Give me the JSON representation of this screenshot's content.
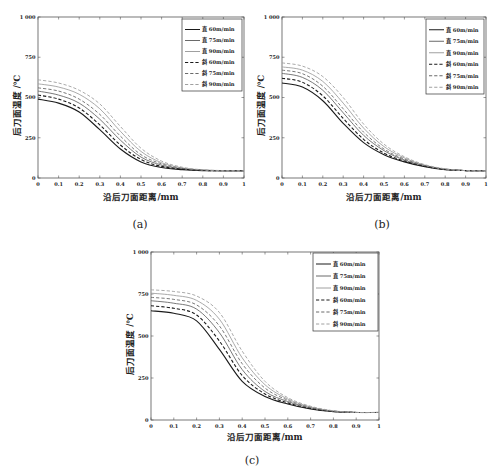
{
  "figure": {
    "captions": [
      "(a)",
      "(b)",
      "(c)"
    ]
  },
  "styles": {
    "series_colors": {
      "60": "#1a1a1a",
      "75": "#6a6a6a",
      "90": "#a0a0a0"
    },
    "axis_color": "#555555",
    "background": "#ffffff"
  },
  "chart_data": [
    {
      "id": "a",
      "type": "line",
      "caption": "(a)",
      "title": "",
      "xlabel": "沿后刀面距离/mm",
      "ylabel": "后刀面温度 /℃",
      "xlim": [
        0,
        1
      ],
      "ylim": [
        0,
        1000
      ],
      "xticks": [
        "0",
        "0.1",
        "0.2",
        "0.3",
        "0.4",
        "0.5",
        "0.6",
        "0.7",
        "0.8",
        "0.9",
        "1"
      ],
      "yticks": [
        "0",
        "250",
        "500",
        "750",
        "1 000"
      ],
      "ytick_values": [
        0,
        250,
        500,
        750,
        1000
      ],
      "grid": false,
      "legend_position": "upper right",
      "x": [
        0,
        0.1,
        0.2,
        0.3,
        0.4,
        0.5,
        0.6,
        0.7,
        0.8,
        0.9,
        1.0
      ],
      "series": [
        {
          "name": "直 60m/min",
          "style": "solid",
          "speed": "60",
          "values": [
            490,
            465,
            410,
            300,
            180,
            100,
            65,
            52,
            46,
            45,
            45
          ]
        },
        {
          "name": "直 75m/min",
          "style": "solid",
          "speed": "75",
          "values": [
            540,
            515,
            465,
            365,
            235,
            130,
            80,
            57,
            48,
            45,
            45
          ]
        },
        {
          "name": "直 90m/min",
          "style": "solid",
          "speed": "90",
          "values": [
            585,
            565,
            520,
            430,
            290,
            165,
            95,
            63,
            50,
            46,
            45
          ]
        },
        {
          "name": "斜 60m/min",
          "style": "dashed",
          "speed": "60",
          "values": [
            515,
            490,
            435,
            330,
            205,
            115,
            72,
            55,
            47,
            45,
            45
          ]
        },
        {
          "name": "斜 75m/min",
          "style": "dashed",
          "speed": "75",
          "values": [
            560,
            540,
            490,
            395,
            260,
            145,
            88,
            60,
            49,
            45,
            45
          ]
        },
        {
          "name": "斜 90m/min",
          "style": "dashed",
          "speed": "90",
          "values": [
            610,
            590,
            545,
            460,
            320,
            185,
            105,
            67,
            51,
            46,
            45
          ]
        }
      ]
    },
    {
      "id": "b",
      "type": "line",
      "caption": "(b)",
      "title": "",
      "xlabel": "沿后刀面距离/mm",
      "ylabel": "后刀面温度 /℃",
      "xlim": [
        0,
        1
      ],
      "ylim": [
        0,
        1000
      ],
      "xticks": [
        "0",
        "0.1",
        "0.2",
        "0.3",
        "0.4",
        "0.5",
        "0.6",
        "0.7",
        "0.8",
        "0.9",
        "1"
      ],
      "yticks": [
        "0",
        "250",
        "500",
        "750",
        "1 000"
      ],
      "ytick_values": [
        0,
        250,
        500,
        750,
        1000
      ],
      "grid": false,
      "legend_position": "upper right",
      "x": [
        0,
        0.1,
        0.2,
        0.3,
        0.4,
        0.5,
        0.6,
        0.7,
        0.8,
        0.9,
        1.0
      ],
      "series": [
        {
          "name": "直 60m/min",
          "style": "solid",
          "speed": "60",
          "values": [
            590,
            565,
            480,
            340,
            220,
            145,
            100,
            70,
            52,
            46,
            45
          ]
        },
        {
          "name": "直 75m/min",
          "style": "solid",
          "speed": "75",
          "values": [
            650,
            625,
            545,
            405,
            265,
            170,
            112,
            76,
            54,
            46,
            45
          ]
        },
        {
          "name": "直 90m/min",
          "style": "solid",
          "speed": "90",
          "values": [
            690,
            670,
            600,
            465,
            310,
            195,
            125,
            80,
            56,
            46,
            45
          ]
        },
        {
          "name": "斜 60m/min",
          "style": "dashed",
          "speed": "60",
          "values": [
            620,
            595,
            510,
            370,
            240,
            155,
            105,
            73,
            53,
            46,
            45
          ]
        },
        {
          "name": "斜 75m/min",
          "style": "dashed",
          "speed": "75",
          "values": [
            670,
            648,
            570,
            430,
            285,
            180,
            118,
            78,
            55,
            46,
            45
          ]
        },
        {
          "name": "斜 90m/min",
          "style": "dashed",
          "speed": "90",
          "values": [
            715,
            695,
            630,
            500,
            335,
            210,
            132,
            83,
            57,
            46,
            45
          ]
        }
      ]
    },
    {
      "id": "c",
      "type": "line",
      "caption": "(c)",
      "title": "",
      "xlabel": "沿后刀面距离/mm",
      "ylabel": "后刀面温度 /℃",
      "xlim": [
        0,
        1
      ],
      "ylim": [
        0,
        1000
      ],
      "xticks": [
        "0",
        "0.1",
        "0.2",
        "0.3",
        "0.4",
        "0.5",
        "0.6",
        "0.7",
        "0.8",
        "0.9",
        "1"
      ],
      "yticks": [
        "0",
        "250",
        "500",
        "750",
        "1 000"
      ],
      "ytick_values": [
        0,
        250,
        500,
        750,
        1000
      ],
      "grid": false,
      "legend_position": "upper right",
      "x": [
        0,
        0.1,
        0.2,
        0.3,
        0.4,
        0.5,
        0.6,
        0.7,
        0.8,
        0.9,
        1.0
      ],
      "series": [
        {
          "name": "直 60m/min",
          "style": "solid",
          "speed": "60",
          "values": [
            650,
            635,
            590,
            420,
            230,
            140,
            95,
            65,
            50,
            45,
            45
          ]
        },
        {
          "name": "直 75m/min",
          "style": "solid",
          "speed": "75",
          "values": [
            710,
            695,
            660,
            520,
            300,
            170,
            110,
            72,
            52,
            45,
            45
          ]
        },
        {
          "name": "直 90m/min",
          "style": "solid",
          "speed": "90",
          "values": [
            755,
            742,
            712,
            600,
            370,
            210,
            125,
            78,
            54,
            45,
            45
          ]
        },
        {
          "name": "斜 60m/min",
          "style": "dashed",
          "speed": "60",
          "values": [
            680,
            665,
            625,
            470,
            265,
            155,
            102,
            68,
            51,
            45,
            45
          ]
        },
        {
          "name": "斜 75m/min",
          "style": "dashed",
          "speed": "75",
          "values": [
            730,
            718,
            685,
            560,
            335,
            190,
            118,
            75,
            53,
            45,
            45
          ]
        },
        {
          "name": "斜 90m/min",
          "style": "dashed",
          "speed": "90",
          "values": [
            775,
            765,
            738,
            640,
            410,
            230,
            133,
            82,
            55,
            45,
            45
          ]
        }
      ]
    }
  ]
}
